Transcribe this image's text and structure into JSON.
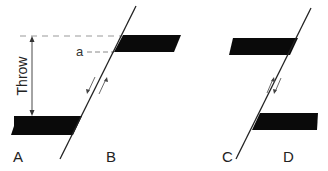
{
  "diagram": {
    "panels": [
      {
        "id": "left",
        "labels": {
          "footwall": "A",
          "hangingwall": "B"
        },
        "annotation_point": "a",
        "measure_label": "Throw",
        "motion": "hanging wall B moves up relative to A (reverse)"
      },
      {
        "id": "right",
        "labels": {
          "left_block": "C",
          "right_block": "D"
        },
        "motion": "block D moves down relative to C"
      }
    ],
    "colors": {
      "bed": "#0a0a0a",
      "line": "#222222",
      "dash": "#888888"
    }
  }
}
